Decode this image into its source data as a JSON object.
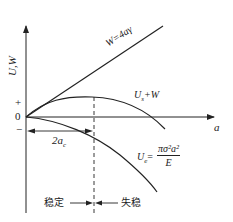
{
  "diagram": {
    "axes": {
      "y_label": "U,W",
      "x_label": "a",
      "tick_plus": "+",
      "tick_zero": "0",
      "tick_minus": "−"
    },
    "curves": {
      "w_line_label": "W=4aγ",
      "sum_curve_label_main": "U",
      "sum_curve_label_sub": "s",
      "sum_curve_label_rest": "+W",
      "elastic_label_main": "U",
      "elastic_label_sub": "e",
      "elastic_label_eq": "=",
      "elastic_numerator": "πσ²a²",
      "elastic_denominator": "E"
    },
    "critical": {
      "label_main": "2a",
      "label_sub": "c"
    },
    "regions": {
      "stable": "稳定",
      "unstable": "失稳"
    },
    "colors": {
      "line": "#222222",
      "background": "#ffffff"
    }
  }
}
